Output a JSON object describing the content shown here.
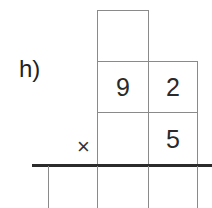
{
  "exercise": {
    "label": "h)",
    "operator": "×",
    "carry_cell": "",
    "multiplicand": [
      "9",
      "2"
    ],
    "multiplier": [
      "",
      "5"
    ],
    "result": [
      "",
      "",
      ""
    ]
  }
}
